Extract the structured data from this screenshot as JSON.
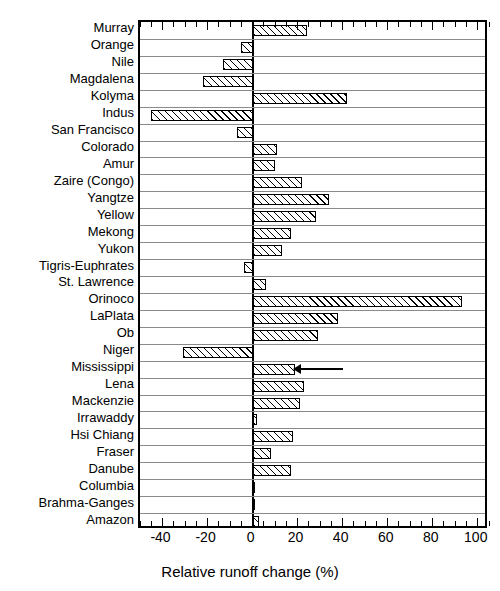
{
  "chart_data": {
    "type": "bar",
    "orientation": "horizontal",
    "title": "",
    "xlabel": "Relative runoff change (%)",
    "ylabel": "",
    "xlim": [
      -50,
      105
    ],
    "ylim": null,
    "grid": "horizontal-row-separators",
    "legend": null,
    "xticks": [
      -40,
      -20,
      0,
      20,
      40,
      60,
      80,
      100
    ],
    "xticklabels": [
      "-40",
      "-20",
      "0",
      "20",
      "40",
      "60",
      "80",
      "100"
    ],
    "minor_tick_interval": 5,
    "categories": [
      "Murray",
      "Orange",
      "Nile",
      "Magdalena",
      "Kolyma",
      "Indus",
      "San Francisco",
      "Colorado",
      "Amur",
      "Zaire (Congo)",
      "Yangtze",
      "Yellow",
      "Mekong",
      "Yukon",
      "Tigris-Euphrates",
      "St. Lawrence",
      "Orinoco",
      "LaPlata",
      "Ob",
      "Niger",
      "Mississippi",
      "Lena",
      "Mackenzie",
      "Irrawaddy",
      "Hsi Chiang",
      "Fraser",
      "Danube",
      "Columbia",
      "Brahma-Ganges",
      "Amazon"
    ],
    "values": [
      24,
      -5,
      -13,
      -22,
      42,
      -45,
      -7,
      11,
      10,
      22,
      34,
      28,
      17,
      13,
      -4,
      6,
      93,
      38,
      29,
      -31,
      19,
      23,
      21,
      2,
      18,
      8,
      17,
      1,
      0.5,
      3
    ],
    "annotations": [
      {
        "type": "arrow",
        "points_to_category": "Mississippi",
        "direction": "left",
        "x_start": 40,
        "x_end": 18
      }
    ],
    "bar_style": {
      "fill": "diagonal-hatch",
      "hatch_color": "#000000",
      "background": "#ffffff",
      "edge_color": "#000000"
    }
  },
  "axis": {
    "x_title": "Relative runoff change (%)"
  }
}
